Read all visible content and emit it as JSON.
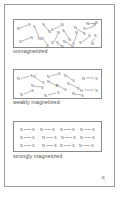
{
  "figure": {
    "letter": "c",
    "panels": [
      {
        "label": "unmagnetized",
        "state": "random",
        "north": "N",
        "south": "S",
        "magnet_count": 16
      },
      {
        "label": "weakly magnetized",
        "state": "partially-aligned",
        "north": "N",
        "south": "S",
        "magnet_count": 11
      },
      {
        "label": "strongly magnetized",
        "state": "aligned",
        "north": "N",
        "south": "S",
        "rows": 3,
        "columns": 4,
        "row_text": "N—S N—S N—S N—S"
      }
    ]
  },
  "colors": {
    "border": "#8a8a8a",
    "text": "#555555",
    "background": "#ffffff"
  }
}
